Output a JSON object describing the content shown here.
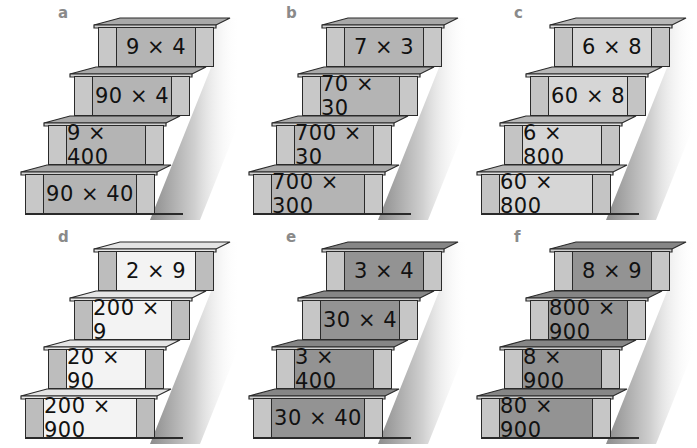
{
  "panels": [
    {
      "id": "a",
      "label": "a",
      "theme": "mid",
      "steps": [
        "9 × 4",
        "90 × 4",
        "9 × 400",
        "90 × 40"
      ]
    },
    {
      "id": "b",
      "label": "b",
      "theme": "mid",
      "steps": [
        "7 × 3",
        "70 × 30",
        "700 × 30",
        "700 × 300"
      ]
    },
    {
      "id": "c",
      "label": "c",
      "theme": "light",
      "steps": [
        "6 × 8",
        "60 × 8",
        "6 × 800",
        "60 × 800"
      ]
    },
    {
      "id": "d",
      "label": "d",
      "theme": "white",
      "steps": [
        "2 × 9",
        "200 × 9",
        "20 × 90",
        "200 × 900"
      ]
    },
    {
      "id": "e",
      "label": "e",
      "theme": "dark",
      "steps": [
        "3 × 4",
        "30 × 4",
        "3 × 400",
        "30 × 40"
      ]
    },
    {
      "id": "f",
      "label": "f",
      "theme": "dark",
      "steps": [
        "8 × 9",
        "800 × 900",
        "8 × 900",
        "80 × 900"
      ]
    }
  ],
  "themes": {
    "mid": {
      "face": "#b4b4b4",
      "post": "#c8c8c8",
      "tread": "#a9a9a9",
      "nose": "#d2d2d2"
    },
    "light": {
      "face": "#d6d6d6",
      "post": "#c4c4c4",
      "tread": "#b8b8b8",
      "nose": "#dedede"
    },
    "white": {
      "face": "#f3f3f3",
      "post": "#bdbdbd",
      "tread": "#e4e4e4",
      "nose": "#e8e8e8"
    },
    "dark": {
      "face": "#939393",
      "post": "#c6c6c6",
      "tread": "#868686",
      "nose": "#cfcfcf"
    }
  }
}
